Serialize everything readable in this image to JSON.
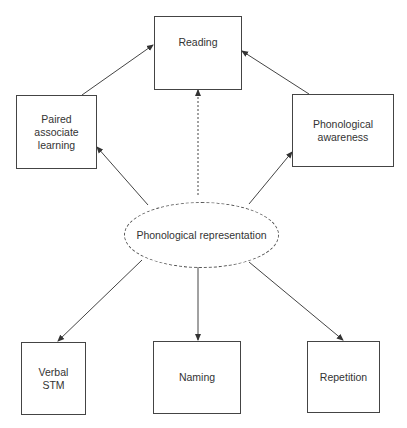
{
  "diagram": {
    "nodes": {
      "reading": {
        "label": "Reading"
      },
      "paired": {
        "line1": "Paired",
        "line2": "associate",
        "line3": "learning"
      },
      "awareness": {
        "line1": "Phonological",
        "line2": "awareness"
      },
      "representation": {
        "line1": "Phonological",
        "line2": "representation"
      },
      "verbal_stm": {
        "line1": "Verbal",
        "line2": "STM"
      },
      "naming": {
        "label": "Naming"
      },
      "repetition": {
        "label": "Repetition"
      }
    },
    "edges": [
      {
        "from": "Phonological representation",
        "to": "Paired associate learning",
        "style": "solid"
      },
      {
        "from": "Phonological representation",
        "to": "Phonological awareness",
        "style": "solid"
      },
      {
        "from": "Phonological representation",
        "to": "Reading",
        "style": "dotted"
      },
      {
        "from": "Paired associate learning",
        "to": "Reading",
        "style": "solid"
      },
      {
        "from": "Phonological awareness",
        "to": "Reading",
        "style": "solid"
      },
      {
        "from": "Phonological representation",
        "to": "Verbal STM",
        "style": "solid"
      },
      {
        "from": "Phonological representation",
        "to": "Naming",
        "style": "solid"
      },
      {
        "from": "Phonological representation",
        "to": "Repetition",
        "style": "solid"
      }
    ],
    "colors": {
      "line": "#444444",
      "background": "#ffffff"
    }
  }
}
